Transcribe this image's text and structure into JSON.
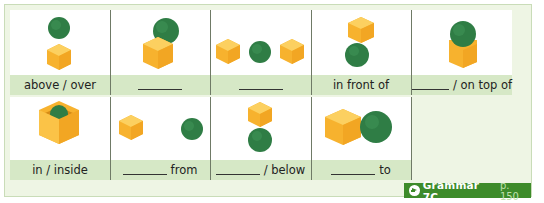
{
  "exercise": {
    "cells": [
      {
        "label": "above / over",
        "has_blank": false,
        "scene": "ball-above-cube"
      },
      {
        "label": "",
        "has_blank": true,
        "suffix": "",
        "scene": "ball-behind-cube"
      },
      {
        "label": "",
        "has_blank": true,
        "suffix": "",
        "scene": "ball-between-cubes"
      },
      {
        "label": "in front of",
        "has_blank": false,
        "scene": "ball-in-front-of-cube"
      },
      {
        "label": "/ on top of",
        "has_blank": true,
        "suffix": "/ on top of",
        "scene": "ball-on-cube"
      },
      {
        "label": "in / inside",
        "has_blank": false,
        "scene": "ball-in-cube"
      },
      {
        "label": "from",
        "has_blank": true,
        "suffix": "from",
        "scene": "ball-far-from-cube"
      },
      {
        "label": "/ below",
        "has_blank": true,
        "suffix": "/ below",
        "scene": "ball-below-cube"
      },
      {
        "label": "to",
        "has_blank": true,
        "suffix": "to",
        "scene": "ball-next-to-cube"
      }
    ]
  },
  "reference": {
    "title": "Grammar 7C",
    "page": "p. 150",
    "icon": "arrow-right-circle-icon"
  },
  "colors": {
    "panel_bg": "#eef5e4",
    "label_bg": "#d6e8c6",
    "ball": "#2f7d45",
    "cube": "#f8bb3a",
    "badge": "#3d8b2a"
  }
}
